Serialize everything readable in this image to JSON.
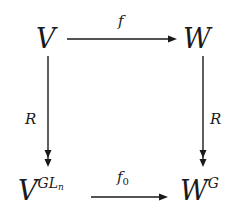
{
  "diagram": {
    "type": "commutative-square",
    "nodes": {
      "top_left": {
        "base": "V"
      },
      "top_right": {
        "base": "W"
      },
      "bottom_left": {
        "base": "V",
        "sup_main": "GL",
        "sup_sub": "n"
      },
      "bottom_right": {
        "base": "W",
        "sup_main": "G"
      }
    },
    "arrows": {
      "top": {
        "label": "f",
        "from": "V",
        "to": "W",
        "style": "single-head"
      },
      "bottom": {
        "label_main": "f",
        "label_sub": "0",
        "from": "V^{GL_n}",
        "to": "W^G",
        "style": "single-head"
      },
      "left": {
        "label": "R",
        "from": "V",
        "to": "V^{GL_n}",
        "style": "double-head (surjection)"
      },
      "right": {
        "label": "R",
        "from": "W",
        "to": "W^G",
        "style": "double-head (surjection)"
      }
    },
    "colors": {
      "ink": "#1a1a1a",
      "background": "#ffffff"
    }
  }
}
